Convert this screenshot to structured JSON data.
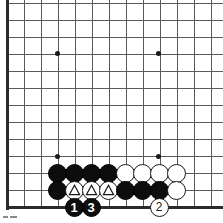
{
  "figure": {
    "kind": "go-board-diagram",
    "board_region": "bottom-left corner",
    "grid": {
      "spacing_px": 17,
      "origin_x": 7,
      "origin_y": 3,
      "columns": 13,
      "rows": 13,
      "edge_left_x": 7,
      "edge_bottom_y": 207,
      "line_color": "#5a5a5a",
      "edge_color": "#2b2b2b",
      "background_color": "#ffffff"
    },
    "star_points": [
      {
        "name": "star-point-upper-left",
        "x": 57,
        "y": 53
      },
      {
        "name": "star-point-upper-right",
        "x": 158,
        "y": 53
      },
      {
        "name": "star-point-lower-left",
        "x": 57,
        "y": 156
      },
      {
        "name": "star-point-lower-right",
        "x": 158,
        "y": 156
      }
    ],
    "stones": [
      {
        "id": "b-r1-c1",
        "color": "black",
        "x": 57,
        "y": 173,
        "label": "",
        "mark": ""
      },
      {
        "id": "b-r1-c2",
        "color": "black",
        "x": 74,
        "y": 173,
        "label": "",
        "mark": ""
      },
      {
        "id": "b-r1-c3",
        "color": "black",
        "x": 91,
        "y": 173,
        "label": "",
        "mark": ""
      },
      {
        "id": "b-r1-c4",
        "color": "black",
        "x": 108,
        "y": 173,
        "label": "",
        "mark": ""
      },
      {
        "id": "w-r1-c5",
        "color": "white",
        "x": 125,
        "y": 173,
        "label": "",
        "mark": ""
      },
      {
        "id": "w-r1-c6",
        "color": "white",
        "x": 142,
        "y": 173,
        "label": "",
        "mark": ""
      },
      {
        "id": "w-r1-c7",
        "color": "white",
        "x": 159,
        "y": 173,
        "label": "",
        "mark": ""
      },
      {
        "id": "w-r1-c8",
        "color": "white",
        "x": 176,
        "y": 173,
        "label": "",
        "mark": ""
      },
      {
        "id": "b-r2-c1",
        "color": "black",
        "x": 57,
        "y": 190,
        "label": "",
        "mark": ""
      },
      {
        "id": "w-r2-c2",
        "color": "white",
        "x": 74,
        "y": 190,
        "label": "",
        "mark": "triangle"
      },
      {
        "id": "w-r2-c3",
        "color": "white",
        "x": 91,
        "y": 190,
        "label": "",
        "mark": "triangle"
      },
      {
        "id": "w-r2-c4",
        "color": "white",
        "x": 108,
        "y": 190,
        "label": "",
        "mark": "triangle"
      },
      {
        "id": "b-r2-c5",
        "color": "black",
        "x": 125,
        "y": 190,
        "label": "",
        "mark": ""
      },
      {
        "id": "b-r2-c6",
        "color": "black",
        "x": 142,
        "y": 190,
        "label": "",
        "mark": ""
      },
      {
        "id": "b-r2-c7",
        "color": "black",
        "x": 159,
        "y": 190,
        "label": "",
        "mark": ""
      },
      {
        "id": "w-r2-c8",
        "color": "white",
        "x": 176,
        "y": 190,
        "label": "",
        "mark": ""
      },
      {
        "id": "move-1",
        "color": "black",
        "x": 74,
        "y": 207,
        "label": "1",
        "mark": ""
      },
      {
        "id": "move-3",
        "color": "black",
        "x": 91,
        "y": 207,
        "label": "3",
        "mark": ""
      },
      {
        "id": "move-2",
        "color": "white",
        "x": 159,
        "y": 207,
        "label": "2",
        "mark": ""
      }
    ],
    "move_numbers": [
      "1",
      "3",
      "2"
    ],
    "footer_marks": [
      {
        "name": "footer-tick-left",
        "x": 3,
        "y": 216,
        "width": 5
      },
      {
        "name": "footer-tick-right",
        "x": 10,
        "y": 216,
        "width": 7
      }
    ]
  }
}
